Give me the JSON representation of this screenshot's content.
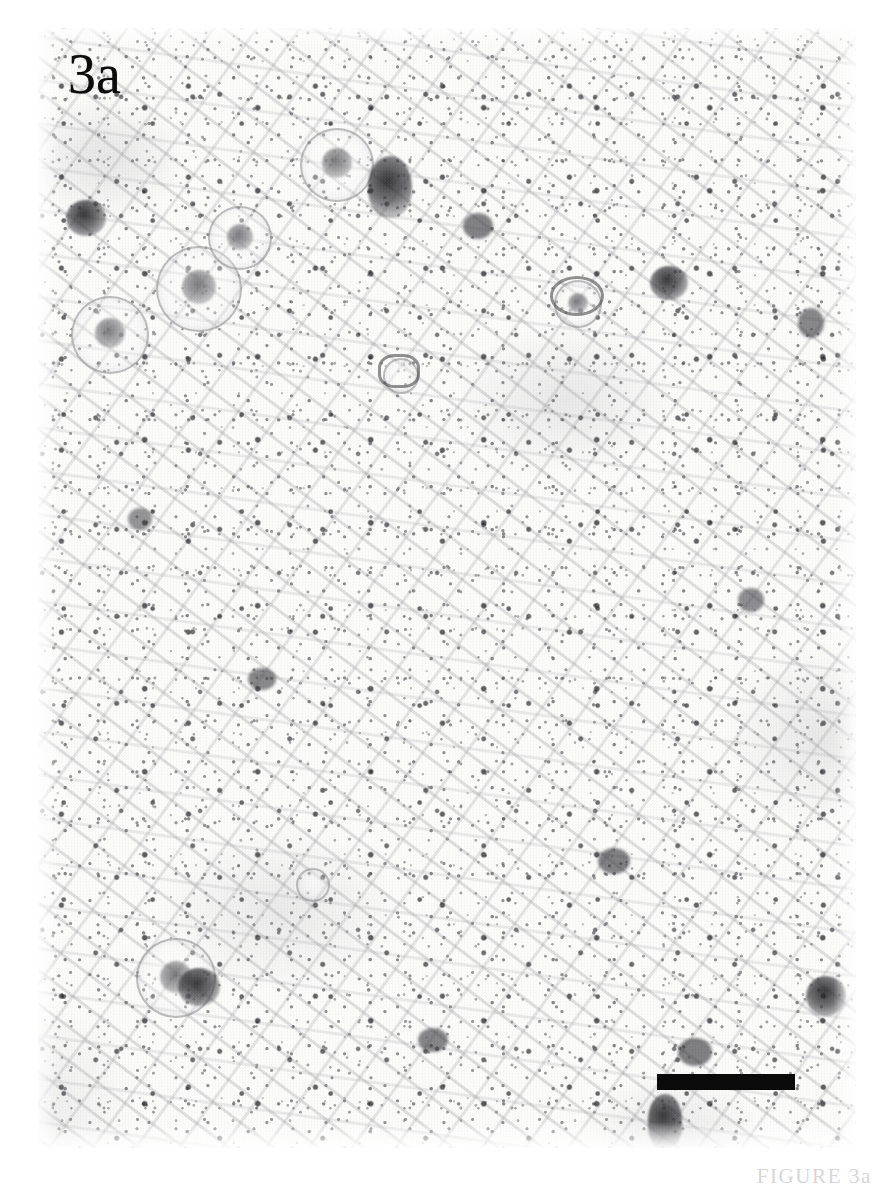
{
  "figure": {
    "panel_label": "3a",
    "caption": "FIGURE 3a",
    "modality": "light-micrograph",
    "staining": "immunohistochemistry",
    "background_color": "#fbfbfa",
    "ink_color": "#1a1a1a"
  },
  "panel": {
    "label": "3a",
    "label_color": "#0b0b0b",
    "left": 38,
    "top": 28,
    "width": 818,
    "height": 1120
  },
  "scale_bar": {
    "name": "scale-bar",
    "color": "#0a0a0a",
    "width_px": 138,
    "height_px": 16,
    "left": 657,
    "top": 1074,
    "label": ""
  },
  "features": {
    "cell_bodies_label": "stained cell somata",
    "neuropil_label": "punctate neuropil staining",
    "cells": [
      {
        "name": "soma-ring-1",
        "x": 118,
        "y": 218,
        "d": 86
      },
      {
        "name": "soma-ring-2",
        "x": 170,
        "y": 178,
        "d": 64
      },
      {
        "name": "soma-ring-3",
        "x": 33,
        "y": 268,
        "d": 78
      },
      {
        "name": "soma-ring-4",
        "x": 262,
        "y": 100,
        "d": 74
      },
      {
        "name": "soma-ring-5",
        "x": 98,
        "y": 910,
        "d": 80
      },
      {
        "name": "soma-ring-6",
        "x": 516,
        "y": 252,
        "d": 48
      },
      {
        "name": "soma-ring-7",
        "x": 345,
        "y": 330,
        "d": 36
      },
      {
        "name": "soma-ring-8",
        "x": 258,
        "y": 840,
        "d": 34
      }
    ],
    "dark_somata": [
      {
        "name": "dark-soma-1",
        "x": 330,
        "y": 128,
        "w": 44,
        "h": 62
      },
      {
        "name": "dark-soma-2",
        "x": 28,
        "y": 172,
        "w": 40,
        "h": 36
      },
      {
        "name": "dark-soma-3",
        "x": 612,
        "y": 238,
        "w": 38,
        "h": 34
      },
      {
        "name": "dark-soma-4",
        "x": 140,
        "y": 940,
        "w": 42,
        "h": 38
      },
      {
        "name": "dark-soma-5",
        "x": 610,
        "y": 1066,
        "w": 34,
        "h": 54
      },
      {
        "name": "dark-soma-6",
        "x": 768,
        "y": 948,
        "w": 40,
        "h": 40
      }
    ]
  }
}
